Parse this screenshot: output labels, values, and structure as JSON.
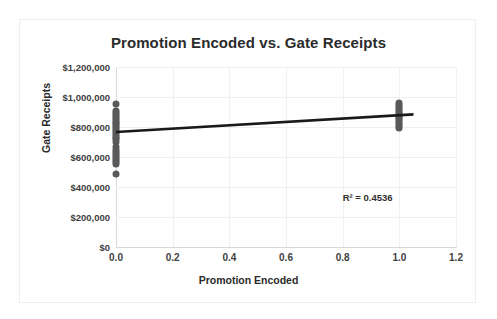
{
  "chart_data": {
    "type": "scatter",
    "title": "Promotion Encoded vs. Gate Receipts",
    "xlabel": "Promotion Encoded",
    "ylabel": "Gate Receipts",
    "xlim": [
      0,
      1.2
    ],
    "ylim": [
      0,
      1200000
    ],
    "grid": true,
    "legend": "none",
    "xticks": [
      "0.0",
      "0.2",
      "0.4",
      "0.6",
      "0.8",
      "1.0",
      "1.2"
    ],
    "xtick_values": [
      0,
      0.2,
      0.4,
      0.6,
      0.8,
      1.0,
      1.2
    ],
    "yticks": [
      "$0",
      "$200,000",
      "$400,000",
      "$600,000",
      "$800,000",
      "$1,000,000",
      "$1,200,000"
    ],
    "ytick_values": [
      0,
      200000,
      400000,
      600000,
      800000,
      1000000,
      1200000
    ],
    "marker_color": "#595959",
    "trendline_color": "#1a1a1a",
    "annotation": "R² = 0.4536",
    "points": [
      {
        "x": 0,
        "y": 955000
      },
      {
        "x": 0,
        "y": 905000
      },
      {
        "x": 0,
        "y": 893000
      },
      {
        "x": 0,
        "y": 880000
      },
      {
        "x": 0,
        "y": 868000
      },
      {
        "x": 0,
        "y": 855000
      },
      {
        "x": 0,
        "y": 842000
      },
      {
        "x": 0,
        "y": 830000
      },
      {
        "x": 0,
        "y": 818000
      },
      {
        "x": 0,
        "y": 805000
      },
      {
        "x": 0,
        "y": 792000
      },
      {
        "x": 0,
        "y": 780000
      },
      {
        "x": 0,
        "y": 768000
      },
      {
        "x": 0,
        "y": 755000
      },
      {
        "x": 0,
        "y": 742000
      },
      {
        "x": 0,
        "y": 730000
      },
      {
        "x": 0,
        "y": 718000
      },
      {
        "x": 0,
        "y": 700000
      },
      {
        "x": 0,
        "y": 668000
      },
      {
        "x": 0,
        "y": 645000
      },
      {
        "x": 0,
        "y": 632000
      },
      {
        "x": 0,
        "y": 620000
      },
      {
        "x": 0,
        "y": 607000
      },
      {
        "x": 0,
        "y": 595000
      },
      {
        "x": 0,
        "y": 582000
      },
      {
        "x": 0,
        "y": 570000
      },
      {
        "x": 0,
        "y": 556000
      },
      {
        "x": 0,
        "y": 490000
      },
      {
        "x": 1.0,
        "y": 960000
      },
      {
        "x": 1.0,
        "y": 947000
      },
      {
        "x": 1.0,
        "y": 933000
      },
      {
        "x": 1.0,
        "y": 920000
      },
      {
        "x": 1.0,
        "y": 908000
      },
      {
        "x": 1.0,
        "y": 895000
      },
      {
        "x": 1.0,
        "y": 882000
      },
      {
        "x": 1.0,
        "y": 870000
      },
      {
        "x": 1.0,
        "y": 857000
      },
      {
        "x": 1.0,
        "y": 845000
      },
      {
        "x": 1.0,
        "y": 832000
      },
      {
        "x": 1.0,
        "y": 820000
      },
      {
        "x": 1.0,
        "y": 808000
      },
      {
        "x": 1.0,
        "y": 795000
      }
    ],
    "trendline": {
      "x0": 0,
      "y0": 767000,
      "x1": 1.05,
      "y1": 884000
    }
  }
}
